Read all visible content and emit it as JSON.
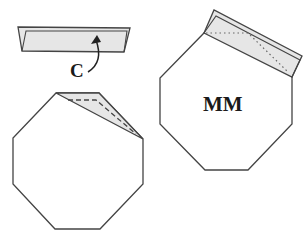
{
  "diagram": {
    "type": "origami-folding-step",
    "colors": {
      "line": "#444444",
      "paper": "#ffffff",
      "folded_flap": "#e6e6e6",
      "text": "#1a1a1a"
    },
    "step_c": {
      "label": "C",
      "description": "Folded strip being turned over along arrow"
    },
    "left_octagon": {
      "description": "Octagon with top-right corner folded (dashed crease line)"
    },
    "right_octagon": {
      "label": "MM",
      "description": "Octagon with folded strip along top-right edge (dotted crease line)"
    }
  }
}
